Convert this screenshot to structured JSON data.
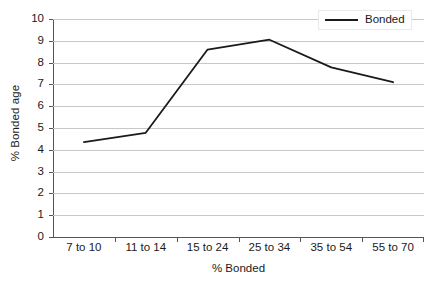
{
  "chart_data": {
    "type": "line",
    "title": "",
    "xlabel": "% Bonded",
    "ylabel": "% Bonded age",
    "categories": [
      "7 to 10",
      "11 to 14",
      "15 to 24",
      "25 to 34",
      "35 to 54",
      "55 to 70"
    ],
    "series": [
      {
        "name": "Bonded",
        "color": "#1a1a1a",
        "values": [
          4.35,
          4.78,
          8.6,
          9.05,
          7.78,
          7.1
        ]
      }
    ],
    "ylim": [
      0,
      10
    ],
    "y_ticks": [
      0,
      1,
      2,
      3,
      4,
      5,
      6,
      7,
      8,
      9,
      10
    ],
    "y_tick_labels": [
      "0",
      "1",
      "2",
      "3",
      "4",
      "5",
      "6",
      "7",
      "8",
      "9",
      "10"
    ],
    "grid": true,
    "grid_axis": "y",
    "grid_color": "#c8c8c8",
    "axis_color": "#555555",
    "background": "#ffffff",
    "legend": {
      "position": "top-right",
      "entries": [
        "Bonded"
      ]
    }
  }
}
